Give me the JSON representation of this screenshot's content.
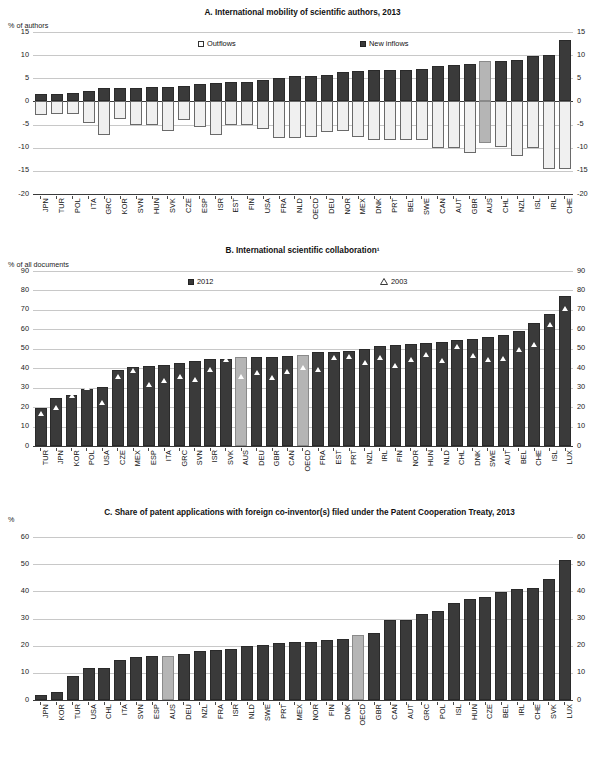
{
  "panels": [
    {
      "id": "A",
      "title": "A. International mobility of scientific authors, 2013",
      "unit": "% of authors",
      "legend": [
        {
          "label": "Outflows",
          "style": "open"
        },
        {
          "label": "New inflows",
          "style": "dark"
        }
      ]
    },
    {
      "id": "B",
      "title": "B. International scientific collaboration¹",
      "unit": "% of all documents",
      "legend": [
        {
          "label": "2012",
          "style": "dark"
        },
        {
          "label": "2003",
          "style": "triangle"
        }
      ]
    },
    {
      "id": "C",
      "title": "C. Share of patent applications with foreign co-inventor(s) filed under the Patent Cooperation Treaty, 2013",
      "unit": "%",
      "legend": []
    }
  ],
  "colors": {
    "bar_dark": "#3a3a3a",
    "bar_light": "#f0f0f0",
    "bar_highlight": "#b5b5b5",
    "grid": "#c8c8c8",
    "axis": "#3a3a3a"
  },
  "chart_data": [
    {
      "type": "bar",
      "title": "A. International mobility of scientific authors, 2013",
      "xlabel": "",
      "ylabel": "% of authors",
      "ylim": [
        -20,
        15
      ],
      "yticks": [
        15,
        10,
        5,
        0,
        -5,
        -10,
        -15,
        -20
      ],
      "grid": true,
      "legend": [
        "Outflows",
        "New inflows"
      ],
      "legend_position": "top-inside",
      "highlight_category": "AUS",
      "categories": [
        "JPN",
        "TUR",
        "POL",
        "ITA",
        "GRC",
        "KOR",
        "SVN",
        "HUN",
        "SVK",
        "CZE",
        "ESP",
        "ISR",
        "EST",
        "FIN",
        "USA",
        "FRA",
        "NLD",
        "OECD",
        "DEU",
        "NOR",
        "MEX",
        "DNK",
        "PRT",
        "BEL",
        "SWE",
        "CAN",
        "AUT",
        "GBR",
        "AUS",
        "CHL",
        "NZL",
        "ISL",
        "IRL",
        "CHE"
      ],
      "series": [
        {
          "name": "New inflows",
          "values": [
            1.5,
            1.6,
            1.8,
            2.3,
            2.8,
            2.9,
            2.9,
            3.1,
            3.2,
            3.4,
            3.8,
            3.9,
            4.1,
            4.3,
            4.7,
            5.0,
            5.6,
            5.6,
            5.7,
            6.3,
            6.6,
            6.7,
            6.8,
            6.8,
            6.9,
            7.6,
            7.8,
            8.0,
            8.7,
            8.8,
            8.9,
            9.8,
            10.1,
            13.3
          ]
        },
        {
          "name": "Outflows",
          "values": [
            -2.9,
            -2.7,
            -2.8,
            -4.6,
            -7.2,
            -3.8,
            -5.1,
            -5.2,
            -6.4,
            -4.0,
            -5.6,
            -7.2,
            -5.1,
            -5.2,
            -6.0,
            -7.8,
            -7.9,
            -7.7,
            -6.6,
            -6.4,
            -7.7,
            -8.3,
            -8.4,
            -8.4,
            -8.4,
            -10.1,
            -10.1,
            -11.1,
            -9.0,
            -9.9,
            -11.8,
            -10.0,
            -14.7,
            -14.7
          ]
        }
      ]
    },
    {
      "type": "bar",
      "title": "B. International scientific collaboration¹",
      "xlabel": "",
      "ylabel": "% of all documents",
      "ylim": [
        0,
        90
      ],
      "yticks": [
        90,
        80,
        70,
        60,
        50,
        40,
        30,
        20,
        10,
        0
      ],
      "grid": true,
      "legend": [
        "2012",
        "2003"
      ],
      "legend_position": "top-inside",
      "highlight_categories": [
        "AUS",
        "OECD"
      ],
      "categories": [
        "TUR",
        "JPN",
        "KOR",
        "POL",
        "USA",
        "CZE",
        "MEX",
        "ESP",
        "ITA",
        "GRC",
        "SVN",
        "ISR",
        "SVK",
        "AUS",
        "DEU",
        "GBR",
        "CAN",
        "OECD",
        "FRA",
        "EST",
        "PRT",
        "NZL",
        "IRL",
        "FIN",
        "NOR",
        "HUN",
        "NLD",
        "CHL",
        "DNK",
        "SWE",
        "AUT",
        "BEL",
        "CHE",
        "ISL",
        "LUX"
      ],
      "series": [
        {
          "name": "2012",
          "values": [
            19.5,
            24.8,
            26.3,
            29.2,
            30.5,
            39.3,
            40.5,
            41.0,
            41.5,
            42.6,
            43.6,
            44.5,
            44.8,
            45.6,
            46.0,
            46.0,
            46.4,
            46.9,
            48.3,
            48.6,
            48.7,
            49.9,
            51.2,
            52.0,
            52.7,
            53.1,
            53.6,
            54.3,
            54.8,
            56.3,
            57.3,
            59.1,
            63.2,
            68.1,
            77.0
          ]
        },
        {
          "name": "2003",
          "values": [
            16.8,
            19.9,
            26.0,
            30.0,
            22.6,
            35.8,
            38.8,
            31.6,
            33.5,
            35.7,
            34.2,
            39.6,
            44.7,
            35.8,
            37.8,
            35.3,
            38.5,
            40.6,
            39.3,
            45.7,
            45.8,
            42.7,
            45.5,
            41.3,
            44.4,
            47.3,
            43.8,
            51.2,
            46.7,
            44.3,
            44.9,
            49.4,
            52.2,
            62.6,
            70.7
          ]
        }
      ]
    },
    {
      "type": "bar",
      "title": "C. Share of patent applications with foreign co-inventor(s) filed under the Patent Cooperation Treaty, 2013",
      "xlabel": "",
      "ylabel": "%",
      "ylim": [
        0,
        60
      ],
      "yticks": [
        60,
        50,
        40,
        30,
        20,
        10,
        0
      ],
      "grid": true,
      "legend": [],
      "highlight_categories": [
        "AUS",
        "OECD"
      ],
      "categories": [
        "JPN",
        "KOR",
        "TUR",
        "USA",
        "CHL",
        "ITA",
        "SVN",
        "ESP",
        "AUS",
        "DEU",
        "NZL",
        "FRA",
        "ISR",
        "NLD",
        "SWE",
        "PRT",
        "MEX",
        "NOR",
        "FIN",
        "DNK",
        "OECD",
        "GBR",
        "CAN",
        "AUT",
        "GRC",
        "POL",
        "ISL",
        "HUN",
        "CZE",
        "BEL",
        "IRL",
        "CHE",
        "SVK",
        "LUX"
      ],
      "series": [
        {
          "name": "Share with foreign co-inventor(s)",
          "values": [
            1.7,
            2.9,
            8.7,
            11.6,
            11.9,
            14.8,
            15.7,
            16.2,
            16.2,
            16.8,
            17.9,
            18.5,
            18.6,
            19.8,
            20.4,
            21.1,
            21.2,
            21.4,
            22.0,
            22.6,
            23.9,
            24.5,
            29.3,
            29.3,
            31.7,
            32.9,
            35.8,
            37.2,
            38.0,
            39.6,
            40.9,
            41.3,
            44.4,
            51.7
          ]
        }
      ]
    }
  ]
}
